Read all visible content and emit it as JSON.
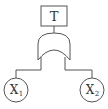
{
  "diagram": {
    "type": "fault-tree",
    "top_event": {
      "label": "T"
    },
    "gate": {
      "type": "OR"
    },
    "basic_events": [
      {
        "label": "X",
        "subscript": "1"
      },
      {
        "label": "X",
        "subscript": "2"
      }
    ],
    "colors": {
      "stroke": "#555555",
      "background": "#ffffff"
    }
  }
}
